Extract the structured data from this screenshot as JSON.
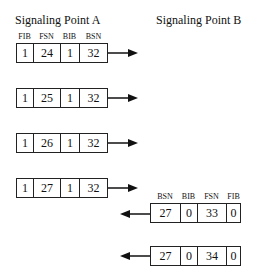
{
  "titles": {
    "point_a": "Signaling Point A",
    "point_b": "Signaling Point B"
  },
  "headers": {
    "a_to_b": [
      "FIB",
      "FSN",
      "BIB",
      "BSN"
    ],
    "b_to_a": [
      "BSN",
      "BIB",
      "FSN",
      "FIB"
    ]
  },
  "frames_a": [
    {
      "fib": "1",
      "fsn": "24",
      "bib": "1",
      "bsn": "32"
    },
    {
      "fib": "1",
      "fsn": "25",
      "bib": "1",
      "bsn": "32"
    },
    {
      "fib": "1",
      "fsn": "26",
      "bib": "1",
      "bsn": "32"
    },
    {
      "fib": "1",
      "fsn": "27",
      "bib": "1",
      "bsn": "32"
    }
  ],
  "frames_b": [
    {
      "bsn": "27",
      "bib": "0",
      "fsn": "33",
      "fib": "0"
    },
    {
      "bsn": "27",
      "bib": "0",
      "fsn": "34",
      "fib": "0"
    }
  ],
  "arrows": {
    "a_direction": "right-arrow",
    "b_direction": "left-arrow"
  }
}
